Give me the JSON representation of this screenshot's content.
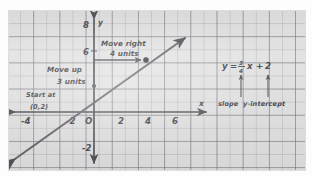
{
  "document": {
    "kind": "handwritten-graph-paper-note",
    "topic": "Graphing a line in slope-intercept form"
  },
  "graph": {
    "axes": {
      "x_label": "x",
      "y_label": "y",
      "origin_label": "O",
      "x_ticks": [
        "-4",
        "-2",
        "2",
        "4",
        "6"
      ],
      "y_ticks": [
        "8",
        "6",
        "-2"
      ]
    },
    "line": {
      "equation_text": "y = 3/4 x + 2",
      "slope": 0.75,
      "y_intercept": 2,
      "points": [
        [
          0,
          2
        ],
        [
          4,
          5
        ]
      ],
      "arrow_both_ends": true
    },
    "plotted_points": [
      {
        "label": "(0,2)",
        "x": 0,
        "y": 2
      },
      {
        "label": "(4,5)",
        "x": 4,
        "y": 5
      }
    ]
  },
  "annotations": {
    "start_line1": "Start at",
    "start_line2": "(0,2)",
    "move_up_line1": "Move up",
    "move_up_line2": "3 units",
    "move_right_line1": "Move right",
    "move_right_line2": "4 units"
  },
  "equation": {
    "y": "y",
    "equals": "=",
    "numerator": "3",
    "denominator": "4",
    "x": "x",
    "plus": "+",
    "constant": "2",
    "label_slope": "slope",
    "label_intercept": "y-intercept"
  },
  "colors": {
    "paper": "#e3e3e3",
    "grid_major": "#787a82",
    "grid_minor": "#969aa0",
    "ink": "#4a4a4f",
    "line_ink": "#6a6a70"
  }
}
